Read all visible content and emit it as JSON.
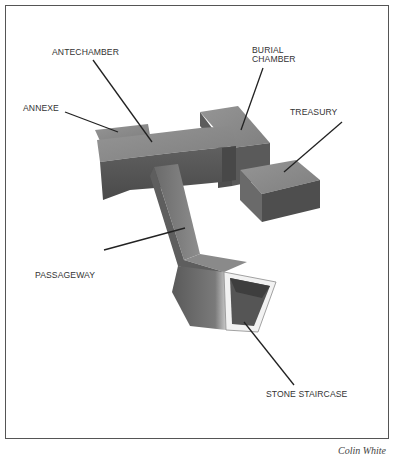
{
  "diagram": {
    "labels": {
      "antechamber": "ANTECHAMBER",
      "annexe": "ANNEXE",
      "burial_chamber_line1": "BURIAL",
      "burial_chamber_line2": "CHAMBER",
      "treasury": "TREASURY",
      "passageway": "PASSAGEWAY",
      "stone_staircase": "STONE STAIRCASE"
    },
    "credit": "Colin White",
    "colors": {
      "frame": "#555555",
      "top_face": "#8a8a8a",
      "front_face": "#555555",
      "side_face": "#6e6e6e",
      "leader_line": "#222222",
      "text": "#333333"
    }
  }
}
